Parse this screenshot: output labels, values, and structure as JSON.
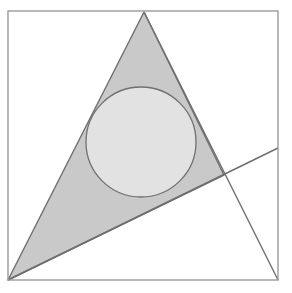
{
  "figure": {
    "canvas": {
      "width": 292,
      "height": 293,
      "background": "#ffffff"
    },
    "colors": {
      "background": "#ffffff",
      "frame_stroke": "#9a9a9a",
      "triangle_fill": "#c9c9c9",
      "triangle_stroke": "#6e6e6e",
      "circle_fill": "#e2e2e2",
      "circle_stroke": "#707070",
      "line_stroke": "#6e6e6e"
    },
    "stroke_widths": {
      "frame": 1.4,
      "triangle": 1.4,
      "circle": 1.3,
      "line": 1.4
    },
    "frame": {
      "label": "square border",
      "x": 8,
      "y": 11,
      "width": 270,
      "height": 269,
      "corners": [
        [
          8,
          11
        ],
        [
          278,
          11
        ],
        [
          278,
          280
        ],
        [
          8,
          280
        ]
      ]
    },
    "triangle": {
      "label": "shaded triangle",
      "points": "144,12 224,175 8,280",
      "vertices": [
        {
          "name": "apex",
          "x": 144,
          "y": 12
        },
        {
          "name": "right",
          "x": 224,
          "y": 175
        },
        {
          "name": "bottom-left",
          "x": 8,
          "y": 280
        }
      ]
    },
    "circle": {
      "label": "inscribed circle",
      "cx": 141,
      "cy": 142,
      "r": 55
    },
    "secant_line": {
      "label": "rising line through bottom-left to right edge",
      "x1": 8,
      "y1": 280,
      "x2": 278,
      "y2": 148
    },
    "extended_edge": {
      "label": "triangle right edge extended to bottom-right corner",
      "x1": 144,
      "y1": 12,
      "x2": 278,
      "y2": 280
    }
  }
}
